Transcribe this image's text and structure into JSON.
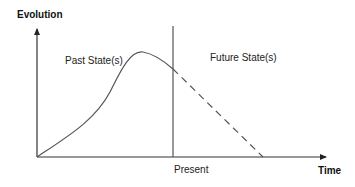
{
  "diagram": {
    "y_axis_label": "Evolution",
    "x_axis_label": "Time",
    "region_left_label": "Past State(s)",
    "region_right_label": "Future State(s)",
    "divider_label": "Present",
    "colors": {
      "line": "#555555",
      "axis": "#333333",
      "text": "#222222"
    }
  }
}
